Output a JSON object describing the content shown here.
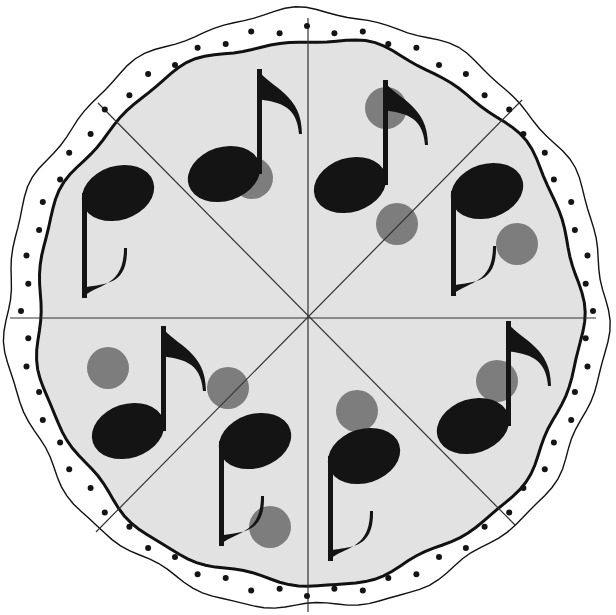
{
  "colors": {
    "background": "#ffffff",
    "crust_fill": "#ffffff",
    "cheese_fill": "#e2e2e2",
    "outline": "#111111",
    "cut_line": "#333333",
    "note": "#141414",
    "pepperoni": "#7d7d7d",
    "crust_dot": "#141414"
  },
  "pizza": {
    "slice_count": 8,
    "slices": [
      {
        "name": "slice-top-left-upper",
        "note_direction": "stem-up",
        "pepperoni_count": 1
      },
      {
        "name": "slice-top-left-lower",
        "note_direction": "stem-down",
        "pepperoni_count": 0
      },
      {
        "name": "slice-top-right-upper",
        "note_direction": "stem-up",
        "pepperoni_count": 2
      },
      {
        "name": "slice-top-right-lower",
        "note_direction": "stem-down",
        "pepperoni_count": 1
      },
      {
        "name": "slice-bottom-left-upper",
        "note_direction": "stem-up",
        "pepperoni_count": 2
      },
      {
        "name": "slice-bottom-left-lower",
        "note_direction": "stem-down",
        "pepperoni_count": 1
      },
      {
        "name": "slice-bottom-right-upper",
        "note_direction": "stem-up",
        "pepperoni_count": 1
      },
      {
        "name": "slice-bottom-right-lower",
        "note_direction": "stem-down",
        "pepperoni_count": 1
      }
    ]
  }
}
